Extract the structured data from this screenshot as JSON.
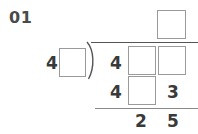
{
  "worksheet": {
    "problem_number": "01",
    "operation": "long-division"
  },
  "colors": {
    "digit": "#3a3a3a",
    "label": "#4a4a4a",
    "box_border": "#9a9a9a",
    "rule": "#555555",
    "background": "#ffffff"
  },
  "quotient": {
    "label": "quotient",
    "cells": [
      {
        "type": "box",
        "value": ""
      }
    ]
  },
  "divisor": {
    "label": "divisor",
    "cells": [
      {
        "type": "digit",
        "value": "4"
      },
      {
        "type": "box",
        "value": ""
      }
    ]
  },
  "dividend": {
    "label": "dividend",
    "cells": [
      {
        "type": "digit",
        "value": "4"
      },
      {
        "type": "box",
        "value": ""
      },
      {
        "type": "box",
        "value": ""
      }
    ]
  },
  "subtrahend": {
    "label": "subtrahend",
    "cells": [
      {
        "type": "digit",
        "value": "4"
      },
      {
        "type": "box",
        "value": ""
      },
      {
        "type": "digit",
        "value": "3"
      }
    ]
  },
  "remainder": {
    "label": "remainder",
    "cells": [
      {
        "type": "digit",
        "value": "2"
      },
      {
        "type": "digit",
        "value": "5"
      }
    ]
  }
}
